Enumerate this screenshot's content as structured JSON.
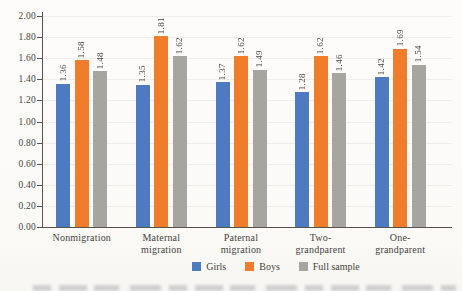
{
  "figure": {
    "paper_color": "#fbfaf7",
    "axis_color": "#56544d",
    "text_color": "#45433d"
  },
  "chart_data": {
    "type": "bar",
    "title": "",
    "xlabel": "",
    "ylabel": "",
    "categories": [
      [
        "Nonmigration"
      ],
      [
        "Maternal",
        "migration"
      ],
      [
        "Paternal",
        "migration"
      ],
      [
        "Two-",
        "grandparent"
      ],
      [
        "One-",
        "grandparent"
      ]
    ],
    "series": [
      {
        "name": "Girls",
        "color": "#4d7ac1",
        "values": [
          1.36,
          1.35,
          1.37,
          1.28,
          1.42
        ]
      },
      {
        "name": "Boys",
        "color": "#ef7d2c",
        "values": [
          1.58,
          1.81,
          1.62,
          1.62,
          1.69
        ]
      },
      {
        "name": "Full sample",
        "color": "#a6a5a0",
        "values": [
          1.48,
          1.62,
          1.49,
          1.46,
          1.54
        ]
      }
    ],
    "y_ticks": [
      "2.00",
      "1.80",
      "1.60",
      "1.40",
      "1.20",
      "1.00",
      "0.80",
      "0.60",
      "0.40",
      "0.20",
      "0.00"
    ],
    "ylim": [
      0,
      2.0
    ],
    "grid": "faint horizontal gridlines at each 0.20",
    "legend_position": "bottom",
    "legend_labels": [
      "Girls",
      "Boys",
      "Full sample"
    ],
    "value_label_style": "rotated 90deg, reads bottom-to-top, above each bar, two decimals"
  }
}
